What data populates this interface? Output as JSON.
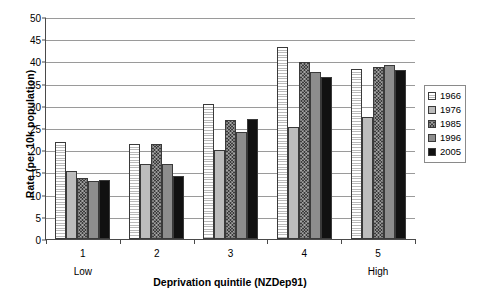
{
  "chart_data": {
    "type": "bar",
    "title": "",
    "xlabel": "Deprivation quintile (NZDep91)",
    "ylabel": "Rate (per 10k population)",
    "categories": [
      "1",
      "2",
      "3",
      "4",
      "5"
    ],
    "category_end_labels": {
      "low": "Low",
      "high": "High"
    },
    "ylim": [
      0,
      50
    ],
    "yticks": [
      0,
      5,
      10,
      15,
      20,
      25,
      30,
      35,
      40,
      45,
      50
    ],
    "grid": true,
    "legend_position": "right",
    "series": [
      {
        "name": "1966",
        "swatch": "horizontal-lines-white",
        "color": "#ffffff",
        "values": [
          21.8,
          21.3,
          30.5,
          43.3,
          38.2
        ]
      },
      {
        "name": "1976",
        "swatch": "light-gray-solid",
        "color": "#bcbcbc",
        "values": [
          15.4,
          16.8,
          20.0,
          25.2,
          27.5
        ]
      },
      {
        "name": "1985",
        "swatch": "dark-crosshatch",
        "color": "#3c3c3c",
        "values": [
          13.8,
          21.3,
          26.8,
          39.8,
          38.8
        ]
      },
      {
        "name": "1996",
        "swatch": "medium-gray-solid",
        "color": "#8d8d8d",
        "values": [
          13.0,
          16.8,
          24.2,
          37.7,
          39.2
        ]
      },
      {
        "name": "2005",
        "swatch": "black-solid",
        "color": "#111111",
        "values": [
          13.3,
          14.3,
          27.0,
          36.4,
          38.0
        ]
      }
    ]
  }
}
